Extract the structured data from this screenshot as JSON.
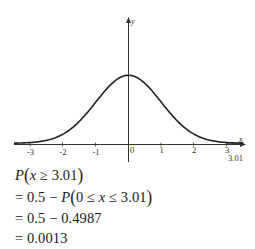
{
  "chart_data": {
    "type": "line",
    "title": "",
    "subtitle": "Standard normal distribution curve with right tail beyond x = 3.01 shaded",
    "xlabel": "x",
    "ylabel": "y",
    "x_ticks": [
      "-3",
      "-2",
      "-1",
      "0",
      "1",
      "2",
      "3"
    ],
    "x_tick_values": [
      -3,
      -2,
      -1,
      0,
      1,
      2,
      3
    ],
    "xlim": [
      -3.5,
      3.5
    ],
    "grid": false,
    "legend": null,
    "series": [
      {
        "name": "standard normal density",
        "function": "y = (1/sqrt(2*pi)) * exp(-x^2/2)",
        "x": [
          -3.5,
          -3,
          -2.5,
          -2,
          -1.5,
          -1,
          -0.5,
          0,
          0.5,
          1,
          1.5,
          2,
          2.5,
          3,
          3.5
        ],
        "values": [
          0.0009,
          0.0044,
          0.0175,
          0.054,
          0.1295,
          0.242,
          0.3521,
          0.3989,
          0.3521,
          0.242,
          0.1295,
          0.054,
          0.0175,
          0.0044,
          0.0009
        ]
      }
    ],
    "annotations": [
      {
        "text": "3.01",
        "x": 3.01,
        "note": "marker below x-axis; shaded tail region from 3.01 to right edge"
      }
    ],
    "shaded_region": {
      "from": 3.01,
      "to": 3.5
    }
  },
  "axes": {
    "y_label": "y",
    "x_label": "x",
    "ticks": [
      "-3",
      "-2",
      "-1",
      "0",
      "1",
      "2",
      "3"
    ],
    "marker_label": "3.01"
  },
  "solution": {
    "line1": {
      "prefix": "P",
      "var": "x",
      "rel": " ≥ 3.01"
    },
    "line2": {
      "prefix": "= 0.5 − P",
      "lhs": "0 ≤ ",
      "var": "x",
      "rhs": " ≤ 3.01"
    },
    "line3": "= 0.5 − 0.4987",
    "line4": "= 0.0013"
  }
}
